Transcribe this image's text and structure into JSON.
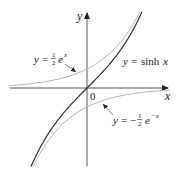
{
  "chart_data": {
    "type": "line",
    "title": "",
    "xlabel": "x",
    "ylabel": "y",
    "origin_label": "0",
    "grid": false,
    "legend": "inline annotations",
    "xlim": [
      -2.0,
      2.1
    ],
    "ylim": [
      -2.0,
      2.0
    ],
    "series": [
      {
        "name": "y = sinh x",
        "function": "sinh(x)",
        "color": "#333333",
        "style": "solid-dark",
        "x": [
          -1.5,
          -1.0,
          -0.5,
          0,
          0.5,
          1.0,
          1.5
        ],
        "values": [
          -2.13,
          -1.18,
          -0.52,
          0,
          0.52,
          1.18,
          2.13
        ]
      },
      {
        "name": "y = 1/2 e^x",
        "function": "0.5*exp(x)",
        "color": "#b8b8b8",
        "style": "solid-light",
        "x": [
          -2.0,
          -1.5,
          -1.0,
          -0.5,
          0,
          0.5,
          1.0,
          1.5
        ],
        "values": [
          0.07,
          0.11,
          0.18,
          0.3,
          0.5,
          0.82,
          1.36,
          2.24
        ]
      },
      {
        "name": "y = -1/2 e^-x",
        "function": "-0.5*exp(-x)",
        "color": "#b8b8b8",
        "style": "solid-light",
        "x": [
          -1.5,
          -1.0,
          -0.5,
          0,
          0.5,
          1.0,
          1.5,
          2.0
        ],
        "values": [
          -2.24,
          -1.36,
          -0.82,
          -0.5,
          -0.3,
          -0.18,
          -0.11,
          -0.07
        ]
      }
    ],
    "annotations": [
      {
        "text": "y = ½ eˣ",
        "y_var": "y",
        "eq": "=",
        "coef_num": "1",
        "coef_den": "2",
        "base": "e",
        "exp": "x",
        "points_to": "y = 1/2 e^x"
      },
      {
        "text": "y = sinh x",
        "y_var": "y",
        "eq": "=",
        "func": "sinh",
        "arg": "x",
        "points_to": "y = sinh x"
      },
      {
        "text": "y = −½ e⁻ˣ",
        "y_var": "y",
        "eq": "=",
        "sign": "−",
        "coef_num": "1",
        "coef_den": "2",
        "base": "e",
        "exp": "−x",
        "points_to": "y = -1/2 e^-x"
      }
    ]
  }
}
